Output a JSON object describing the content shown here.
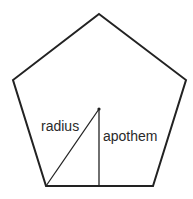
{
  "diagram": {
    "shape": "regular-pentagon",
    "stroke_color": "#222222",
    "vertices": [
      {
        "name": "top",
        "x": 99,
        "y": 14
      },
      {
        "name": "right",
        "x": 186,
        "y": 80
      },
      {
        "name": "bottom-right",
        "x": 153,
        "y": 186
      },
      {
        "name": "bottom-left",
        "x": 46,
        "y": 186
      },
      {
        "name": "left",
        "x": 13,
        "y": 80
      }
    ],
    "center": {
      "x": 99,
      "y": 109
    },
    "segments": {
      "radius": {
        "label": "radius",
        "from": "center",
        "to": "bottom-left"
      },
      "apothem": {
        "label": "apothem",
        "from": "center",
        "to": "bottom-edge-midpoint"
      }
    },
    "labels": {
      "radius": "radius",
      "apothem": "apothem"
    }
  }
}
